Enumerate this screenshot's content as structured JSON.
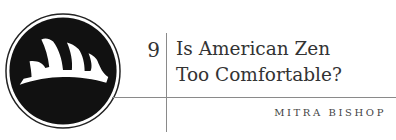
{
  "chapter": {
    "number": "9",
    "title_line1": "Is American Zen",
    "title_line2": "Too Comfortable?",
    "author": "MITRA BISHOP"
  },
  "logo": {
    "icon": "zen-mountain-emblem-icon"
  }
}
